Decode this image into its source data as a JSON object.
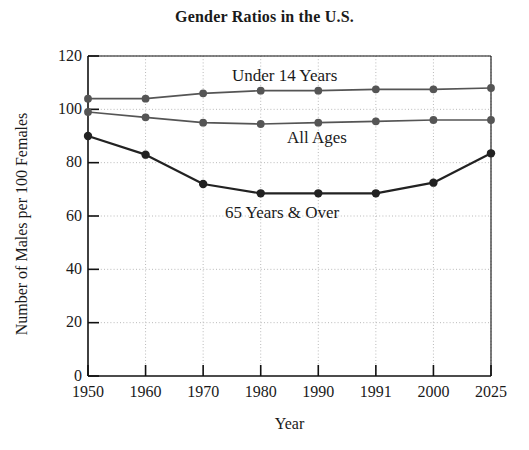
{
  "chart_data": {
    "type": "line",
    "title": "Gender Ratios in the U.S.",
    "xlabel": "Year",
    "ylabel": "Number of Males per 100 Females",
    "categories": [
      "1950",
      "1960",
      "1970",
      "1980",
      "1990",
      "1991",
      "2000",
      "2025"
    ],
    "ylim": [
      0,
      120
    ],
    "yticks": [
      "0",
      "20",
      "40",
      "60",
      "80",
      "100",
      "120"
    ],
    "grid": true,
    "legend": "inline-labels",
    "series": [
      {
        "name": "Under 14 Years",
        "color": "#555555",
        "values": [
          104,
          104,
          106,
          107,
          107,
          107.5,
          107.5,
          108
        ]
      },
      {
        "name": "All Ages",
        "color": "#555555",
        "values": [
          99,
          97,
          95,
          94.5,
          95,
          95.5,
          96,
          96
        ]
      },
      {
        "name": "65 Years & Over",
        "color": "#222222",
        "values": [
          90,
          83,
          72,
          68.5,
          68.5,
          68.5,
          72.5,
          83.5
        ]
      }
    ]
  },
  "annotations": {
    "under14_label": "Under 14 Years",
    "allages_label": "All Ages",
    "over65_label": "65 Years & Over"
  },
  "style": {
    "axis_color": "#111111",
    "grid_color": "#b9b9b9",
    "background": "#ffffff"
  }
}
